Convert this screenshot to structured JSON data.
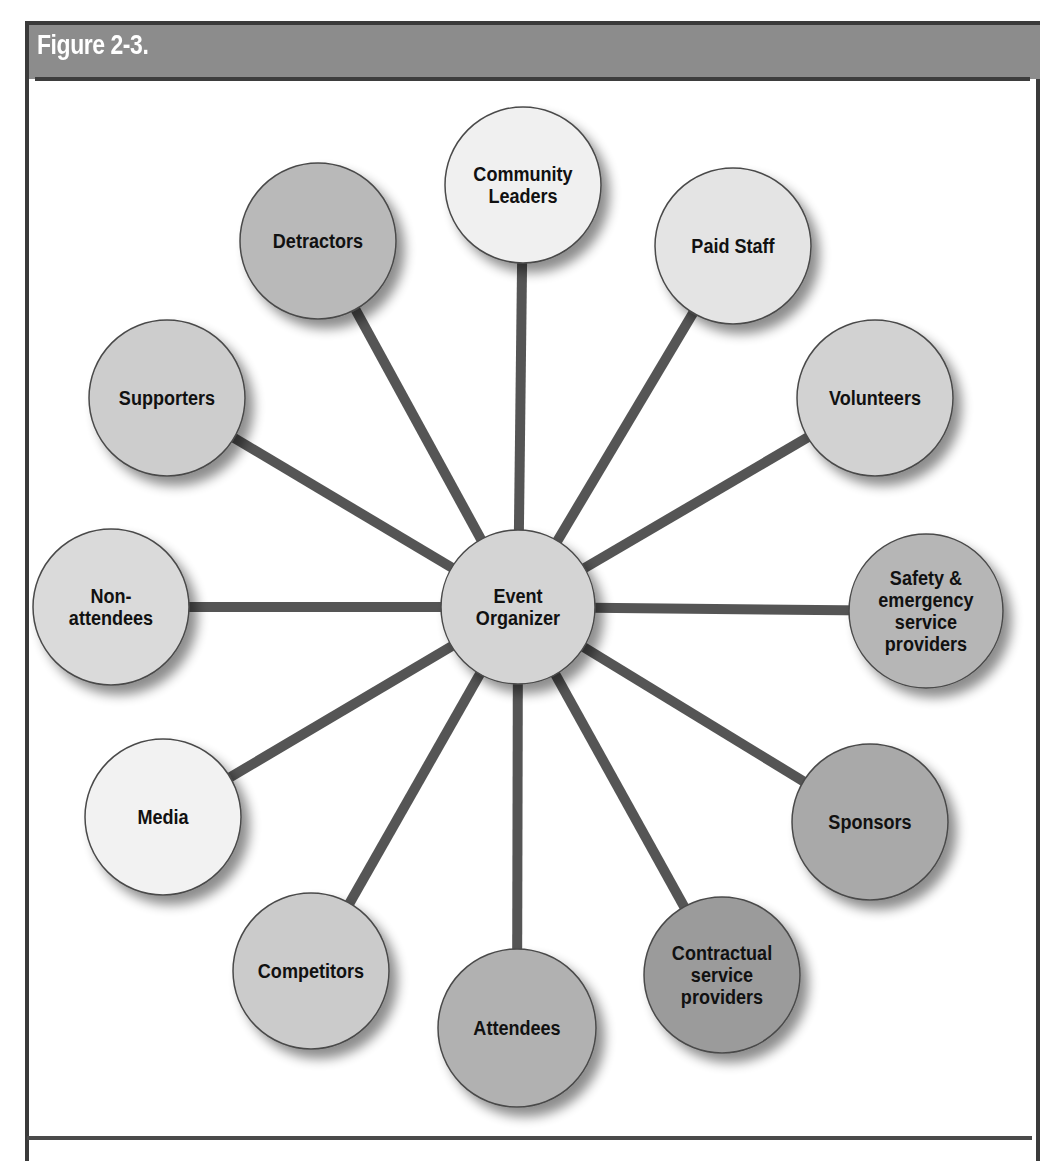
{
  "figure": {
    "title": "Figure 2-3."
  },
  "diagram": {
    "type": "hub-and-spoke",
    "center": {
      "id": "event-organizer",
      "lines": [
        "Event",
        "Organizer"
      ],
      "cx": 518,
      "cy": 607,
      "r": 77,
      "fill": "#d4d4d4"
    },
    "spoke_color": "#555555",
    "spoke_width": 10,
    "nodes": [
      {
        "id": "community-leaders",
        "lines": [
          "Community",
          "Leaders"
        ],
        "cx": 523,
        "cy": 185,
        "r": 78,
        "fill": "#f0f0f0"
      },
      {
        "id": "paid-staff",
        "lines": [
          "Paid Staff"
        ],
        "cx": 733,
        "cy": 246,
        "r": 78,
        "fill": "#e4e4e4"
      },
      {
        "id": "volunteers",
        "lines": [
          "Volunteers"
        ],
        "cx": 875,
        "cy": 398,
        "r": 78,
        "fill": "#d2d2d2"
      },
      {
        "id": "safety-emergency",
        "lines": [
          "Safety &",
          "emergency",
          "service",
          "providers"
        ],
        "cx": 926,
        "cy": 611,
        "r": 77,
        "fill": "#b6b6b6"
      },
      {
        "id": "sponsors",
        "lines": [
          "Sponsors"
        ],
        "cx": 870,
        "cy": 822,
        "r": 78,
        "fill": "#a9a9a9"
      },
      {
        "id": "contractual-service-providers",
        "lines": [
          "Contractual",
          "service",
          "providers"
        ],
        "cx": 722,
        "cy": 975,
        "r": 78,
        "fill": "#9b9b9b"
      },
      {
        "id": "attendees",
        "lines": [
          "Attendees"
        ],
        "cx": 517,
        "cy": 1028,
        "r": 79,
        "fill": "#b1b1b1"
      },
      {
        "id": "competitors",
        "lines": [
          "Competitors"
        ],
        "cx": 311,
        "cy": 971,
        "r": 78,
        "fill": "#cbcbcb"
      },
      {
        "id": "media",
        "lines": [
          "Media"
        ],
        "cx": 163,
        "cy": 817,
        "r": 78,
        "fill": "#f2f2f2"
      },
      {
        "id": "non-attendees",
        "lines": [
          "Non-",
          "attendees"
        ],
        "cx": 111,
        "cy": 607,
        "r": 78,
        "fill": "#dadada"
      },
      {
        "id": "supporters",
        "lines": [
          "Supporters"
        ],
        "cx": 167,
        "cy": 398,
        "r": 78,
        "fill": "#cdcdcd"
      },
      {
        "id": "detractors",
        "lines": [
          "Detractors"
        ],
        "cx": 318,
        "cy": 241,
        "r": 78,
        "fill": "#b9b9b9"
      }
    ]
  }
}
